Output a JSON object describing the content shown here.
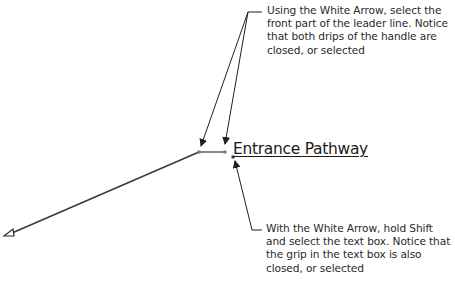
{
  "diagram": {
    "label": "Entrance Pathway",
    "annotations": [
      {
        "id": "top",
        "text": "Using the White Arrow, select the front part of the leader line.  Notice that both drips of the handle are closed, or selected"
      },
      {
        "id": "bottom",
        "text": "With the White Arrow, hold Shift and select the text box.  Notice that the grip in the text box is also closed, or selected"
      }
    ],
    "colors": {
      "leader_line": "#3a3a3a",
      "landing_segment": "#7a7a7a",
      "callout_line": "#1f1f1f",
      "text": "#2a2a2a"
    }
  }
}
